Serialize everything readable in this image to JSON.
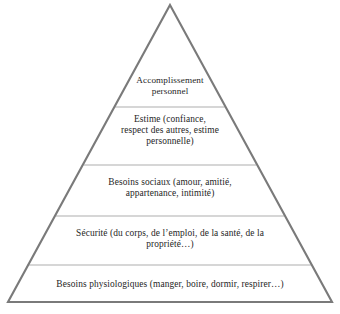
{
  "diagram": {
    "type": "pyramid",
    "language": "fr",
    "background_color": "#ffffff",
    "outline_color": "#7a7a7a",
    "divider_color": "#c8c8c8",
    "text_color": "#262626",
    "geometry": {
      "apex": [
        170,
        5
      ],
      "base_left": [
        8,
        302
      ],
      "base_right": [
        332,
        302
      ],
      "divider_y": [
        107,
        165,
        216,
        265
      ]
    },
    "levels": [
      {
        "index": 1,
        "position": "top",
        "name": "accomplissement-personnel",
        "text": "Accomplissement\npersonnel",
        "lines": [
          "Accomplissement",
          "personnel"
        ]
      },
      {
        "index": 2,
        "position": "second",
        "name": "estime",
        "text": "Estime (confiance,\nrespect des autres, estime\npersonnelle)",
        "lines": [
          "Estime (confiance,",
          "respect des autres, estime",
          "personnelle)"
        ]
      },
      {
        "index": 3,
        "position": "middle",
        "name": "besoins-sociaux",
        "text": "Besoins sociaux (amour, amitié,\nappartenance, intimité)",
        "lines": [
          "Besoins sociaux (amour, amitié,",
          "appartenance, intimité)"
        ]
      },
      {
        "index": 4,
        "position": "fourth",
        "name": "securite",
        "text": "Sécurité (du corps, de l’emploi, de la santé, de la\npropriété…)",
        "lines": [
          "Sécurité (du corps, de l’emploi, de la santé, de la",
          "propriété…)"
        ]
      },
      {
        "index": 5,
        "position": "base",
        "name": "besoins-physiologiques",
        "text": "Besoins physiologiques (manger, boire, dormir, respirer…)",
        "lines": [
          "Besoins physiologiques (manger, boire, dormir, respirer…)"
        ]
      }
    ]
  }
}
